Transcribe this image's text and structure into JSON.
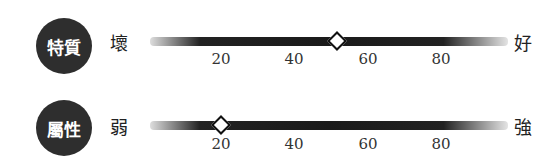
{
  "scales": [
    {
      "badge": "特質",
      "low_label": "壞",
      "high_label": "好",
      "value": 52,
      "ticks": [
        "20",
        "40",
        "60",
        "80"
      ]
    },
    {
      "badge": "屬性",
      "low_label": "弱",
      "high_label": "強",
      "value": 20,
      "ticks": [
        "20",
        "40",
        "60",
        "80"
      ]
    }
  ],
  "colors": {
    "badge": "#2e2e2e",
    "track": "#1a1a1a",
    "marker_fill": "#ffffff"
  }
}
